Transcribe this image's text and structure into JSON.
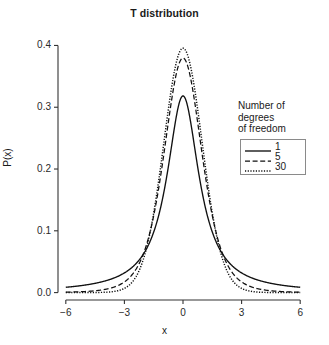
{
  "chart_data": {
    "type": "line",
    "title": "T distribution",
    "xlabel": "x",
    "ylabel": "P(x)",
    "xlim": [
      -6.4,
      6.4
    ],
    "ylim": [
      -0.012,
      0.425
    ],
    "xticks": [
      -6,
      -3,
      0,
      3,
      6
    ],
    "xtick_labels": [
      "−6",
      "−3",
      "0",
      "3",
      "6"
    ],
    "yticks": [
      0.0,
      0.1,
      0.2,
      0.3,
      0.4
    ],
    "ytick_labels": [
      "0.0",
      "0.1",
      "0.2",
      "0.3",
      "0.4"
    ],
    "grid": false,
    "legend_position": "right",
    "legend_title_lines": [
      "Number of",
      "degrees",
      "of freedom"
    ],
    "x": [
      -6,
      -5.75,
      -5.5,
      -5.25,
      -5,
      -4.75,
      -4.5,
      -4.25,
      -4,
      -3.75,
      -3.5,
      -3.25,
      -3,
      -2.75,
      -2.5,
      -2.25,
      -2,
      -1.75,
      -1.5,
      -1.25,
      -1,
      -0.75,
      -0.5,
      -0.25,
      0,
      0.25,
      0.5,
      0.75,
      1,
      1.25,
      1.5,
      1.75,
      2,
      2.25,
      2.5,
      2.75,
      3,
      3.25,
      3.5,
      3.75,
      4,
      4.25,
      4.5,
      4.75,
      5,
      5.25,
      5.5,
      5.75,
      6
    ],
    "series": [
      {
        "name": "1",
        "label": "1",
        "df": 1,
        "style": "solid",
        "color": "#111111",
        "peak": 0.3183,
        "values": [
          0.0086,
          0.0094,
          0.0102,
          0.0112,
          0.0122,
          0.0135,
          0.0149,
          0.0165,
          0.0187,
          0.021,
          0.0239,
          0.0274,
          0.0318,
          0.0372,
          0.0439,
          0.0525,
          0.0637,
          0.0784,
          0.0979,
          0.1241,
          0.1592,
          0.2037,
          0.2546,
          0.2995,
          0.3183,
          0.2995,
          0.2546,
          0.2037,
          0.1592,
          0.1241,
          0.0979,
          0.0784,
          0.0637,
          0.0525,
          0.0439,
          0.0372,
          0.0318,
          0.0274,
          0.0239,
          0.021,
          0.0187,
          0.0165,
          0.0149,
          0.0135,
          0.0122,
          0.0112,
          0.0102,
          0.0094,
          0.0086
        ]
      },
      {
        "name": "5",
        "label": "5",
        "df": 5,
        "style": "dashed",
        "color": "#111111",
        "peak": 0.3796,
        "values": [
          0.0011,
          0.0014,
          0.0017,
          0.0021,
          0.0026,
          0.0033,
          0.0042,
          0.0054,
          0.007,
          0.0092,
          0.0122,
          0.0164,
          0.0222,
          0.0305,
          0.0422,
          0.0586,
          0.0807,
          0.1089,
          0.1428,
          0.1803,
          0.2196,
          0.2573,
          0.2896,
          0.3132,
          0.3796,
          0.3132,
          0.2896,
          0.2573,
          0.2196,
          0.1803,
          0.1428,
          0.1089,
          0.0807,
          0.0586,
          0.0422,
          0.0305,
          0.0222,
          0.0164,
          0.0122,
          0.0092,
          0.007,
          0.0054,
          0.0042,
          0.0033,
          0.0026,
          0.0021,
          0.0017,
          0.0014,
          0.0011
        ]
      },
      {
        "name": "30",
        "label": "30",
        "df": 30,
        "style": "dotted",
        "color": "#111111",
        "peak": 0.3956,
        "values": [
          0.0,
          0.0,
          0.0,
          0.0001,
          0.0001,
          0.0002,
          0.0004,
          0.0007,
          0.0013,
          0.0023,
          0.004,
          0.0069,
          0.0115,
          0.0188,
          0.0297,
          0.0455,
          0.0674,
          0.0962,
          0.132,
          0.1735,
          0.2177,
          0.2601,
          0.2959,
          0.3209,
          0.3956,
          0.3209,
          0.2959,
          0.2601,
          0.2177,
          0.1735,
          0.132,
          0.0962,
          0.0674,
          0.0455,
          0.0297,
          0.0188,
          0.0115,
          0.0069,
          0.004,
          0.0023,
          0.0013,
          0.0007,
          0.0004,
          0.0002,
          0.0001,
          0.0001,
          0.0,
          0.0,
          0.0
        ]
      }
    ]
  },
  "plot": {
    "left": 58,
    "right": 308,
    "top": 30,
    "bottom": 300,
    "axis_color": "#333333"
  }
}
